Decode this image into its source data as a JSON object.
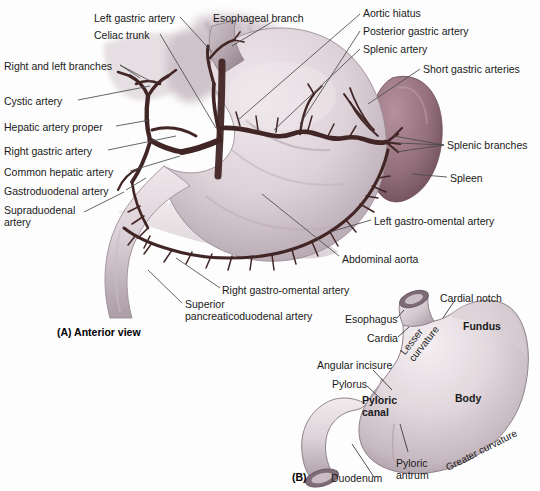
{
  "figure": {
    "panels": [
      {
        "tag": "(A) Anterior view",
        "id": "panel-a"
      },
      {
        "tag": "(B)",
        "id": "panel-b"
      }
    ]
  },
  "panel_a": {
    "tag": "(A) Anterior view",
    "labels": [
      {
        "id": "left-gastric-artery",
        "text": "Left gastric artery",
        "x": 94,
        "y": 12,
        "align": "left"
      },
      {
        "id": "esophageal-branch",
        "text": "Esophageal branch",
        "x": 213,
        "y": 12,
        "align": "left"
      },
      {
        "id": "aortic-hiatus",
        "text": "Aortic hiatus",
        "x": 363,
        "y": 7,
        "align": "left"
      },
      {
        "id": "celiac-trunk",
        "text": "Celiac trunk",
        "x": 94,
        "y": 29,
        "align": "left"
      },
      {
        "id": "posterior-gastric-artery",
        "text": "Posterior gastric artery",
        "x": 363,
        "y": 25,
        "align": "left"
      },
      {
        "id": "splenic-artery",
        "text": "Splenic artery",
        "x": 363,
        "y": 43,
        "align": "left"
      },
      {
        "id": "right-and-left-branches",
        "text": "Right and left branches",
        "x": 4,
        "y": 60,
        "align": "left"
      },
      {
        "id": "short-gastric-arteries",
        "text": "Short gastric arteries",
        "x": 423,
        "y": 63,
        "align": "left"
      },
      {
        "id": "cystic-artery",
        "text": "Cystic artery",
        "x": 4,
        "y": 95,
        "align": "left"
      },
      {
        "id": "hepatic-artery-proper",
        "text": "Hepatic artery proper",
        "x": 4,
        "y": 121,
        "align": "left"
      },
      {
        "id": "splenic-branches",
        "text": "Splenic branches",
        "x": 447,
        "y": 139,
        "align": "left"
      },
      {
        "id": "right-gastric-artery",
        "text": "Right gastric artery",
        "x": 4,
        "y": 145,
        "align": "left"
      },
      {
        "id": "common-hepatic-artery",
        "text": "Common hepatic artery",
        "x": 4,
        "y": 166,
        "align": "left"
      },
      {
        "id": "spleen",
        "text": "Spleen",
        "x": 450,
        "y": 172,
        "align": "left"
      },
      {
        "id": "gastroduodenal-artery",
        "text": "Gastroduodenal artery",
        "x": 4,
        "y": 185,
        "align": "left"
      },
      {
        "id": "supraduodenal-artery",
        "text": "Supraduodenal\nartery",
        "x": 4,
        "y": 204,
        "align": "left"
      },
      {
        "id": "left-gastro-omental-artery",
        "text": "Left gastro-omental artery",
        "x": 374,
        "y": 215,
        "align": "left"
      },
      {
        "id": "abdominal-aorta",
        "text": "Abdominal aorta",
        "x": 342,
        "y": 253,
        "align": "left"
      },
      {
        "id": "right-gastro-omental-artery",
        "text": "Right gastro-omental artery",
        "x": 222,
        "y": 284,
        "align": "left"
      },
      {
        "id": "superior-pancreaticoduodenal-artery",
        "text": "Superior\npancreaticoduodenal artery",
        "x": 185,
        "y": 298,
        "align": "left"
      }
    ]
  },
  "panel_b": {
    "tag": "(B)",
    "labels": [
      {
        "id": "cardial-notch",
        "text": "Cardial notch",
        "x": 440,
        "y": 292,
        "bold": false
      },
      {
        "id": "esophagus",
        "text": "Esophagus",
        "x": 345,
        "y": 313,
        "bold": false
      },
      {
        "id": "fundus",
        "text": "Fundus",
        "x": 463,
        "y": 320,
        "bold": true
      },
      {
        "id": "cardia",
        "text": "Cardia",
        "x": 367,
        "y": 332,
        "bold": false
      },
      {
        "id": "angular-incisure",
        "text": "Angular incisure",
        "x": 317,
        "y": 359,
        "bold": false
      },
      {
        "id": "pylorus",
        "text": "Pylorus",
        "x": 332,
        "y": 378,
        "bold": false
      },
      {
        "id": "body",
        "text": "Body",
        "x": 455,
        "y": 392,
        "bold": true
      },
      {
        "id": "pyloric-canal",
        "text": "Pyloric\ncanal",
        "x": 362,
        "y": 394,
        "bold": true
      },
      {
        "id": "pyloric-antrum",
        "text": "Pyloric\nantrum",
        "x": 396,
        "y": 457,
        "bold": false
      },
      {
        "id": "duodenum",
        "text": "Duodenum",
        "x": 331,
        "y": 472,
        "bold": false
      }
    ],
    "rotated_labels": [
      {
        "id": "lesser-curvature",
        "line1": "Lesser",
        "line2": "curvature",
        "x": 398,
        "y": 350,
        "angle": -52
      },
      {
        "id": "greater-curvature",
        "text": "Greater curvature",
        "x": 444,
        "y": 463,
        "angle": -27
      }
    ]
  },
  "colors": {
    "background": "#fdfdfd",
    "artery": "#4a2b2b",
    "artery_dark": "#331c1c",
    "stomach_light": "#e6dde2",
    "stomach_mid": "#cfc2c9",
    "stomach_shadow": "#a89aa4",
    "spleen": "#9b7580",
    "spleen_dark": "#7d5b66",
    "duodenum": "#d8ccd2",
    "liver_shade": "#d3c8cd",
    "leader_line": "#555555",
    "text": "#1a1a1a"
  }
}
